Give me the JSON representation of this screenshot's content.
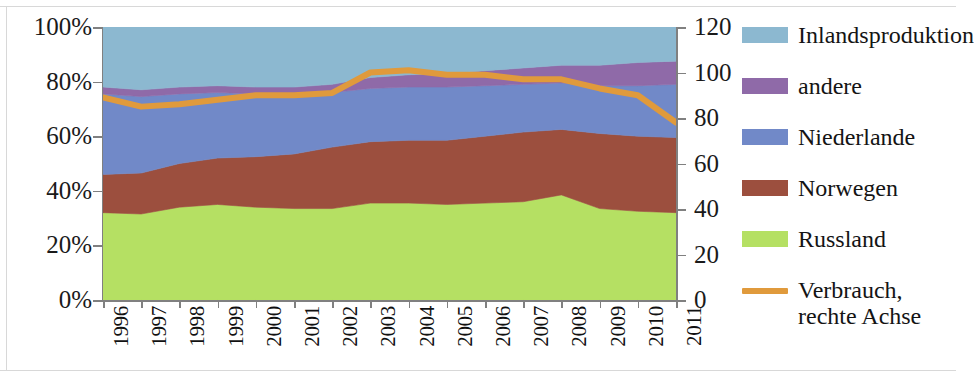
{
  "chart_data": {
    "type": "area",
    "title": "",
    "subtitle": "",
    "xlabel": "",
    "ylabel": "",
    "stacked": true,
    "normalized_percent": true,
    "grid": true,
    "legend_position": "right",
    "categories": [
      "1996",
      "1997",
      "1998",
      "1999",
      "2000",
      "2001",
      "2002",
      "2003",
      "2004",
      "2005",
      "2006",
      "2007",
      "2008",
      "2009",
      "2010",
      "2011"
    ],
    "x_tick_labels": [
      "1996",
      "1997",
      "1998",
      "1999",
      "2000",
      "2001",
      "2002",
      "2003",
      "2004",
      "2005",
      "2006",
      "2007",
      "2008",
      "2009",
      "2010",
      "2011"
    ],
    "left_axis": {
      "label": "",
      "ylim": [
        0,
        100
      ],
      "tick_labels": [
        "100%",
        "80%",
        "60%",
        "40%",
        "20%",
        "0%"
      ],
      "tick_values": [
        100,
        80,
        60,
        40,
        20,
        0
      ],
      "unit": "%"
    },
    "right_axis": {
      "label": "Verbrauch, rechte Achse",
      "ylim": [
        0,
        120
      ],
      "tick_labels": [
        "120",
        "100",
        "80",
        "60",
        "40",
        "20",
        "0"
      ],
      "tick_values": [
        120,
        100,
        80,
        60,
        40,
        20,
        0
      ]
    },
    "series": [
      {
        "name": "Russland",
        "color": "#b5e063",
        "axis": "left",
        "values": [
          32.0,
          31.5,
          34.0,
          35.0,
          34.0,
          33.5,
          33.5,
          35.5,
          35.5,
          35.0,
          35.5,
          36.0,
          38.5,
          33.5,
          32.5,
          32.0
        ]
      },
      {
        "name": "Norwegen",
        "color": "#9c4f3e",
        "axis": "left",
        "values": [
          14.0,
          15.0,
          16.0,
          17.0,
          18.5,
          20.0,
          22.5,
          22.5,
          23.0,
          23.5,
          24.5,
          25.5,
          24.0,
          27.5,
          27.5,
          27.5
        ]
      },
      {
        "name": "Niederlande",
        "color": "#7189c8",
        "axis": "left",
        "values": [
          29.5,
          28.0,
          25.5,
          24.0,
          23.0,
          22.0,
          20.0,
          19.5,
          19.5,
          19.5,
          18.5,
          17.5,
          17.0,
          17.5,
          18.5,
          19.5
        ]
      },
      {
        "name": "andere",
        "color": "#8f6aa8",
        "axis": "left",
        "values": [
          2.5,
          2.5,
          2.5,
          2.5,
          2.5,
          2.5,
          3.0,
          4.0,
          4.5,
          5.0,
          5.5,
          6.0,
          6.5,
          7.5,
          8.5,
          8.5
        ]
      },
      {
        "name": "Inlandsproduktion",
        "color": "#8cb8d0",
        "axis": "left",
        "values": [
          22.0,
          23.0,
          22.0,
          21.5,
          22.0,
          22.0,
          21.0,
          18.5,
          17.5,
          17.0,
          16.0,
          15.0,
          14.0,
          14.0,
          13.0,
          12.5
        ]
      }
    ],
    "line_series": {
      "name": "Verbrauch, rechte Achse",
      "color": "#e09a3c",
      "axis": "right",
      "values": [
        89,
        85,
        86,
        88,
        90,
        90,
        91,
        100,
        101,
        99,
        99,
        97,
        97,
        93,
        90,
        78
      ]
    }
  },
  "legend": {
    "items": [
      {
        "label": "Inlandsproduktion",
        "color": "#8cb8d0",
        "marker": "swatch"
      },
      {
        "label": "andere",
        "color": "#8f6aa8",
        "marker": "swatch"
      },
      {
        "label": "Niederlande",
        "color": "#7189c8",
        "marker": "swatch"
      },
      {
        "label": "Norwegen",
        "color": "#9c4f3e",
        "marker": "swatch"
      },
      {
        "label": "Russland",
        "color": "#b5e063",
        "marker": "swatch"
      },
      {
        "label": "Verbrauch,\nrechte Achse",
        "color": "#e09a3c",
        "marker": "line"
      }
    ]
  }
}
